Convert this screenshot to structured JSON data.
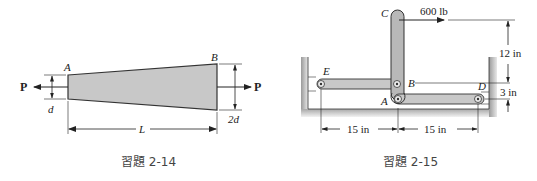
{
  "figures": [
    {
      "caption": "習題 2-14",
      "labels": {
        "point_a": "A",
        "point_b": "B",
        "force_left": "P",
        "force_right": "P",
        "diameter_left": "d",
        "diameter_right": "2d",
        "length": "L"
      }
    },
    {
      "caption": "習題 2-15",
      "labels": {
        "point_a": "A",
        "point_b": "B",
        "point_c": "C",
        "point_d": "D",
        "point_e": "E",
        "force": "600 lb",
        "height_cb": "12 in",
        "height_bd": "3 in",
        "span_ea": "15 in",
        "span_ad": "15 in"
      }
    }
  ],
  "colors": {
    "member_fill": "#c8c8c8",
    "member_stroke": "#333333",
    "wall_fill": "#bdbdbd",
    "line": "#222222"
  }
}
